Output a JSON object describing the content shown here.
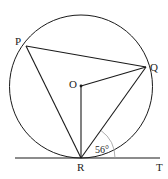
{
  "diagram": {
    "points": {
      "P": {
        "label": "P",
        "x": 26,
        "y": 46
      },
      "Q": {
        "label": "Q",
        "x": 146,
        "y": 67
      },
      "O": {
        "label": "O",
        "x": 81,
        "y": 86
      },
      "R": {
        "label": "R",
        "x": 81,
        "y": 158
      },
      "T": {
        "label": "T",
        "x": 160,
        "y": 158
      }
    },
    "circle": {
      "cx": 81,
      "cy": 86.5,
      "r": 71.5
    },
    "segments": [
      "PQ",
      "PR",
      "QR",
      "OQ",
      "OR",
      "RT"
    ],
    "angle": {
      "vertex": "R",
      "between": [
        "Q",
        "T"
      ],
      "label": "56°"
    },
    "colors": {
      "line": "#1a1a1a",
      "arc": "#999999"
    }
  }
}
